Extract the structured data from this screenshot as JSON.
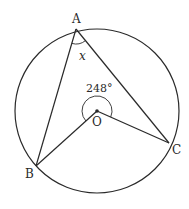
{
  "diagram": {
    "type": "circle-geometry",
    "circle": {
      "center_label": "O"
    },
    "points": [
      {
        "label": "A",
        "role": "point on circumference"
      },
      {
        "label": "B",
        "role": "point on circumference"
      },
      {
        "label": "C",
        "role": "point on circumference"
      },
      {
        "label": "O",
        "role": "centre"
      }
    ],
    "segments": [
      "AB",
      "AC",
      "OB",
      "OC"
    ],
    "angles": {
      "inscribed": {
        "vertex": "A",
        "label": "x"
      },
      "reflex_central": {
        "vertex": "O",
        "label": "248°"
      }
    },
    "colors": {
      "stroke": "#2a2a2a",
      "background": "#ffffff"
    }
  }
}
